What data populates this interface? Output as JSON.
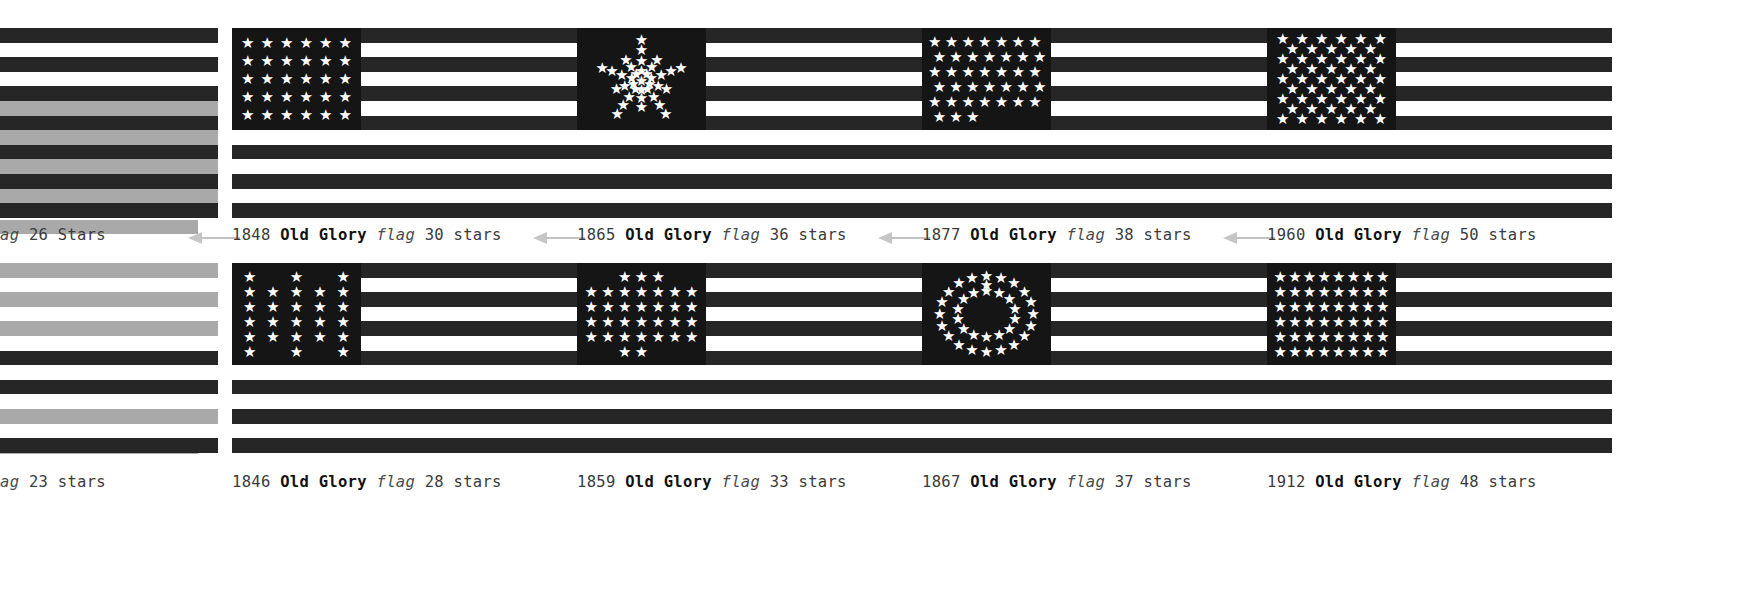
{
  "page": {
    "background": "#ffffff",
    "ink": "#262626",
    "canton": "#151515",
    "arrow_color": "#c6c6c6",
    "artifact_grey": "#a9a9a9"
  },
  "labels": {
    "name": "Old Glory",
    "flag_word": "flag",
    "stars_word": "stars",
    "stars_word_cap": "Stars"
  },
  "rows": [
    {
      "id": "top",
      "flags": [
        {
          "id": "flag-26-stars",
          "year": "",
          "name": "",
          "flag_word": "ag",
          "count": "26",
          "stars_word": "Stars",
          "caption": "ag 26 Stars",
          "partial": true,
          "star_layout": "none",
          "stars": 0,
          "arrow": false,
          "has_canton": false
        },
        {
          "id": "flag-30-stars",
          "year": "1848",
          "name": "Old Glory",
          "flag_word": "flag",
          "count": "30",
          "stars_word": "stars",
          "caption": "1848 Old Glory flag 30 stars",
          "partial": false,
          "star_layout": "grid",
          "grid": {
            "cols": 6,
            "rows": 5
          },
          "stars": 30,
          "arrow": true,
          "has_canton": true
        },
        {
          "id": "flag-36-stars",
          "year": "1865",
          "name": "Old Glory",
          "flag_word": "flag",
          "count": "36",
          "stars_word": "stars",
          "caption": "1865 Old Glory flag 36 stars",
          "partial": false,
          "star_layout": "great-star",
          "stars": 36,
          "arrow": true,
          "has_canton": true
        },
        {
          "id": "flag-38-stars",
          "year": "1877",
          "name": "Old Glory",
          "flag_word": "flag",
          "count": "38",
          "stars_word": "stars",
          "caption": "1877 Old Glory flag 38 stars",
          "partial": false,
          "star_layout": "saltire",
          "stars": 38,
          "arrow": true,
          "has_canton": true
        },
        {
          "id": "flag-50-stars",
          "year": "1960",
          "name": "Old Glory",
          "flag_word": "flag",
          "count": "50",
          "stars_word": "stars",
          "caption": "1960 Old Glory flag 50 stars",
          "partial": false,
          "star_layout": "staggered",
          "grid": {
            "cols": 6,
            "rows": 9
          },
          "stars": 50,
          "arrow": true,
          "has_canton": true
        }
      ]
    },
    {
      "id": "bottom",
      "flags": [
        {
          "id": "flag-23-stars",
          "year": "",
          "name": "",
          "flag_word": "ag",
          "count": "23",
          "stars_word": "stars",
          "caption": "ag 23 stars",
          "partial": true,
          "star_layout": "none",
          "stars": 0,
          "arrow": false,
          "has_canton": false
        },
        {
          "id": "flag-28-stars",
          "year": "1846",
          "name": "Old Glory",
          "flag_word": "flag",
          "count": "28",
          "stars_word": "stars",
          "caption": "1846 Old Glory flag 28 stars",
          "partial": false,
          "star_layout": "hollow-rect",
          "stars": 28,
          "arrow": false,
          "has_canton": true
        },
        {
          "id": "flag-33-stars",
          "year": "1859",
          "name": "Old Glory",
          "flag_word": "flag",
          "count": "33",
          "stars_word": "stars",
          "caption": "1859 Old Glory flag 33 stars",
          "partial": false,
          "star_layout": "diamond",
          "stars": 33,
          "arrow": false,
          "has_canton": true
        },
        {
          "id": "flag-37-stars",
          "year": "1867",
          "name": "Old Glory",
          "flag_word": "flag",
          "count": "37",
          "stars_word": "stars",
          "caption": "1867 Old Glory flag 37 stars",
          "partial": false,
          "star_layout": "medallion",
          "stars": 37,
          "arrow": false,
          "has_canton": true
        },
        {
          "id": "flag-48-stars",
          "year": "1912",
          "name": "Old Glory",
          "flag_word": "flag",
          "count": "48",
          "stars_word": "stars",
          "caption": "1912 Old Glory flag 48 stars",
          "partial": false,
          "star_layout": "grid",
          "grid": {
            "cols": 8,
            "rows": 6
          },
          "stars": 48,
          "arrow": false,
          "has_canton": true
        }
      ]
    }
  ]
}
